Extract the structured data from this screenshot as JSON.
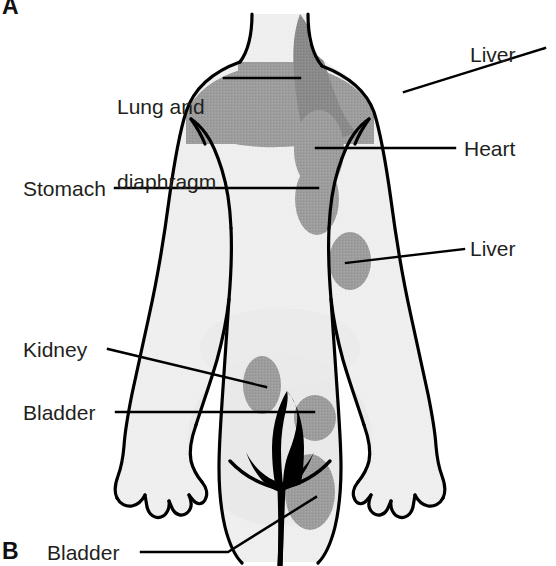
{
  "figure": {
    "panels": [
      {
        "id": "A",
        "letter": "A"
      },
      {
        "id": "B",
        "letter": "B"
      }
    ],
    "view": "posterior",
    "colors": {
      "background": "#ffffff",
      "outline": "#000000",
      "body_fill": "#efefef",
      "body_fill_light": "#f7f7f7",
      "zone_fill": "#9d9d9d",
      "zone_fill_dark": "#8a8a8a",
      "label_text": "#231f20",
      "leader_line": "#000000"
    }
  },
  "labels": {
    "lung_and_diaphragm": {
      "line1": "Lung and",
      "line2": "diaphragm",
      "side": "left"
    },
    "stomach": {
      "text": "Stomach",
      "side": "left"
    },
    "kidney": {
      "text": "Kidney",
      "side": "left"
    },
    "bladder_left": {
      "text": "Bladder",
      "side": "left"
    },
    "bladder_bottom": {
      "text": "Bladder",
      "side": "left"
    },
    "liver_top": {
      "text": "Liver",
      "side": "right"
    },
    "heart": {
      "text": "Heart",
      "side": "right"
    },
    "liver_lower": {
      "text": "Liver",
      "side": "right"
    }
  },
  "zones": [
    {
      "name": "lung-and-diaphragm-zone",
      "organ": "Lung and diaphragm",
      "region": "upper back / shoulders",
      "shape": "band"
    },
    {
      "name": "liver-top-zone",
      "organ": "Liver",
      "region": "right shoulder",
      "shape": "crescent"
    },
    {
      "name": "heart-zone",
      "organ": "Heart",
      "region": "upper mid-back",
      "shape": "oval"
    },
    {
      "name": "stomach-zone",
      "organ": "Stomach",
      "region": "mid-back",
      "shape": "oval"
    },
    {
      "name": "liver-lower-zone",
      "organ": "Liver",
      "region": "right flank",
      "shape": "oval"
    },
    {
      "name": "kidney-zone",
      "organ": "Kidney",
      "region": "left lower back",
      "shape": "oval"
    },
    {
      "name": "bladder-sacral-zone",
      "organ": "Bladder",
      "region": "sacrum",
      "shape": "oval"
    },
    {
      "name": "bladder-gluteal-zone",
      "organ": "Bladder",
      "region": "gluteal cleft",
      "shape": "oval"
    }
  ]
}
